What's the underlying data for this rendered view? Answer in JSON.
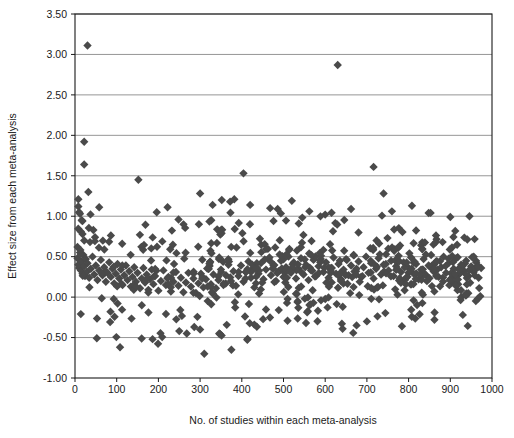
{
  "chart_data": {
    "type": "scatter",
    "title": "",
    "xlabel": "No. of studies within each meta-analysis",
    "ylabel": "Effect size from each meta-analysis",
    "xlim": [
      0,
      1000
    ],
    "ylim": [
      -1.0,
      3.5
    ],
    "xticks": [
      0,
      100,
      200,
      300,
      400,
      500,
      600,
      700,
      800,
      900,
      1000
    ],
    "xtick_labels": [
      "0",
      "100",
      "200",
      "300",
      "400",
      "500",
      "600",
      "700",
      "800",
      "900",
      "1000"
    ],
    "yticks": [
      -1.0,
      -0.5,
      0.0,
      0.5,
      1.0,
      1.5,
      2.0,
      2.5,
      3.0,
      3.5
    ],
    "ytick_labels": [
      "-1.00",
      "-0.50",
      "0.00",
      "0.50",
      "1.00",
      "1.50",
      "2.00",
      "2.50",
      "3.00",
      "3.50"
    ],
    "grid": "horizontal",
    "legend": "none",
    "marker": "diamond",
    "marker_color": "#4a4a4a",
    "marker_size": 4.2,
    "frame_color": "#1a1a1a",
    "grid_color": "#8a8a8a",
    "n_points": 700,
    "points": [
      [
        30,
        3.11
      ],
      [
        630,
        2.87
      ],
      [
        22,
        1.92
      ],
      [
        22,
        1.64
      ],
      [
        32,
        1.3
      ],
      [
        58,
        1.11
      ],
      [
        152,
        1.45
      ],
      [
        8,
        1.21
      ],
      [
        8,
        1.12
      ],
      [
        10,
        1.05
      ],
      [
        12,
        1.03
      ],
      [
        18,
        0.94
      ],
      [
        16,
        0.95
      ],
      [
        14,
        0.81
      ],
      [
        18,
        0.78
      ],
      [
        44,
        0.83
      ],
      [
        48,
        0.74
      ],
      [
        36,
        0.68
      ],
      [
        404,
        1.53
      ],
      [
        716,
        1.61
      ],
      [
        300,
        1.28
      ],
      [
        330,
        1.14
      ],
      [
        222,
        1.11
      ],
      [
        196,
        1.05
      ],
      [
        352,
        1.2
      ],
      [
        372,
        1.18
      ],
      [
        382,
        1.21
      ],
      [
        420,
        1.14
      ],
      [
        468,
        1.1
      ],
      [
        486,
        1.09
      ],
      [
        520,
        1.19
      ],
      [
        562,
        1.06
      ],
      [
        600,
        1.02
      ],
      [
        662,
        1.09
      ],
      [
        740,
        1.28
      ],
      [
        760,
        1.06
      ],
      [
        808,
        1.13
      ],
      [
        848,
        1.04
      ],
      [
        900,
        0.99
      ],
      [
        946,
        1.0
      ],
      [
        108,
        -0.62
      ],
      [
        310,
        -0.7
      ],
      [
        375,
        -0.65
      ],
      [
        186,
        -0.52
      ],
      [
        250,
        -0.42
      ],
      [
        268,
        -0.45
      ],
      [
        346,
        -0.45
      ],
      [
        348,
        -0.46
      ],
      [
        286,
        -0.37
      ],
      [
        300,
        -0.4
      ],
      [
        430,
        -0.34
      ],
      [
        640,
        -0.33
      ],
      [
        700,
        -0.3
      ],
      [
        784,
        -0.36
      ],
      [
        862,
        -0.28
      ],
      [
        930,
        -0.22
      ],
      [
        966,
        -0.02
      ],
      [
        972,
        0.01
      ],
      [
        6,
        0.62
      ],
      [
        6,
        0.48
      ],
      [
        8,
        0.4
      ],
      [
        10,
        0.36
      ],
      [
        12,
        0.55
      ],
      [
        14,
        0.33
      ],
      [
        16,
        0.44
      ],
      [
        18,
        0.29
      ],
      [
        20,
        0.52
      ],
      [
        22,
        0.38
      ],
      [
        24,
        0.26
      ],
      [
        26,
        0.47
      ],
      [
        28,
        0.31
      ],
      [
        30,
        0.42
      ],
      [
        34,
        0.24
      ],
      [
        38,
        0.35
      ],
      [
        42,
        0.5
      ],
      [
        46,
        0.28
      ],
      [
        50,
        0.39
      ],
      [
        54,
        0.21
      ],
      [
        58,
        0.33
      ],
      [
        62,
        0.46
      ],
      [
        66,
        0.27
      ],
      [
        70,
        0.37
      ],
      [
        74,
        0.19
      ],
      [
        78,
        0.3
      ],
      [
        82,
        0.43
      ],
      [
        86,
        0.25
      ],
      [
        90,
        0.35
      ],
      [
        94,
        0.17
      ],
      [
        98,
        0.29
      ],
      [
        102,
        0.41
      ],
      [
        106,
        0.23
      ],
      [
        110,
        0.34
      ],
      [
        114,
        0.15
      ],
      [
        118,
        0.27
      ],
      [
        122,
        0.39
      ],
      [
        126,
        0.21
      ],
      [
        130,
        0.32
      ],
      [
        134,
        0.13
      ],
      [
        138,
        0.25
      ],
      [
        142,
        0.37
      ],
      [
        146,
        0.19
      ],
      [
        150,
        0.3
      ],
      [
        156,
        0.11
      ],
      [
        160,
        0.23
      ],
      [
        164,
        0.36
      ],
      [
        168,
        0.18
      ],
      [
        172,
        0.28
      ],
      [
        176,
        0.09
      ],
      [
        180,
        0.22
      ],
      [
        184,
        0.34
      ],
      [
        188,
        0.16
      ],
      [
        192,
        0.26
      ],
      [
        200,
        0.08
      ],
      [
        206,
        0.2
      ],
      [
        212,
        0.33
      ],
      [
        218,
        0.15
      ],
      [
        224,
        0.25
      ],
      [
        230,
        0.07
      ],
      [
        236,
        0.19
      ],
      [
        242,
        0.31
      ],
      [
        248,
        0.14
      ],
      [
        254,
        0.24
      ],
      [
        260,
        0.06
      ],
      [
        266,
        0.18
      ],
      [
        272,
        0.3
      ],
      [
        278,
        0.13
      ],
      [
        284,
        0.23
      ],
      [
        290,
        0.05
      ],
      [
        296,
        0.17
      ],
      [
        302,
        0.29
      ],
      [
        308,
        0.12
      ],
      [
        314,
        0.22
      ],
      [
        320,
        0.35
      ],
      [
        326,
        0.16
      ],
      [
        332,
        0.28
      ],
      [
        338,
        0.11
      ],
      [
        344,
        0.21
      ],
      [
        350,
        0.34
      ],
      [
        356,
        0.15
      ],
      [
        362,
        0.27
      ],
      [
        368,
        0.4
      ],
      [
        374,
        0.2
      ],
      [
        380,
        0.32
      ],
      [
        386,
        0.14
      ],
      [
        392,
        0.26
      ],
      [
        398,
        0.39
      ],
      [
        404,
        0.19
      ],
      [
        410,
        0.31
      ],
      [
        416,
        0.44
      ],
      [
        422,
        0.24
      ],
      [
        428,
        0.36
      ],
      [
        434,
        0.17
      ],
      [
        440,
        0.29
      ],
      [
        446,
        0.42
      ],
      [
        452,
        0.22
      ],
      [
        458,
        0.34
      ],
      [
        464,
        0.47
      ],
      [
        470,
        0.27
      ],
      [
        476,
        0.39
      ],
      [
        482,
        0.2
      ],
      [
        488,
        0.32
      ],
      [
        494,
        0.45
      ],
      [
        500,
        0.25
      ],
      [
        506,
        0.37
      ],
      [
        512,
        0.5
      ],
      [
        518,
        0.3
      ],
      [
        524,
        0.42
      ],
      [
        530,
        0.23
      ],
      [
        536,
        0.35
      ],
      [
        542,
        0.48
      ],
      [
        548,
        0.28
      ],
      [
        554,
        0.4
      ],
      [
        560,
        0.21
      ],
      [
        566,
        0.33
      ],
      [
        572,
        0.46
      ],
      [
        578,
        0.26
      ],
      [
        584,
        0.38
      ],
      [
        590,
        0.51
      ],
      [
        596,
        0.31
      ],
      [
        602,
        0.43
      ],
      [
        608,
        0.24
      ],
      [
        614,
        0.36
      ],
      [
        620,
        0.49
      ],
      [
        626,
        0.29
      ],
      [
        632,
        0.41
      ],
      [
        638,
        0.22
      ],
      [
        644,
        0.34
      ],
      [
        650,
        0.47
      ],
      [
        656,
        0.27
      ],
      [
        662,
        0.39
      ],
      [
        668,
        0.52
      ],
      [
        674,
        0.32
      ],
      [
        680,
        0.44
      ],
      [
        686,
        0.25
      ],
      [
        692,
        0.37
      ],
      [
        698,
        0.5
      ],
      [
        704,
        0.3
      ],
      [
        710,
        0.42
      ],
      [
        716,
        0.23
      ],
      [
        722,
        0.35
      ],
      [
        728,
        0.48
      ],
      [
        734,
        0.28
      ],
      [
        740,
        0.4
      ],
      [
        746,
        0.53
      ],
      [
        752,
        0.33
      ],
      [
        758,
        0.45
      ],
      [
        764,
        0.26
      ],
      [
        770,
        0.38
      ],
      [
        776,
        0.51
      ],
      [
        782,
        0.31
      ],
      [
        788,
        0.43
      ],
      [
        794,
        0.24
      ],
      [
        800,
        0.36
      ],
      [
        806,
        0.49
      ],
      [
        812,
        0.29
      ],
      [
        818,
        0.41
      ],
      [
        824,
        0.22
      ],
      [
        830,
        0.34
      ],
      [
        836,
        0.47
      ],
      [
        842,
        0.27
      ],
      [
        848,
        0.39
      ],
      [
        854,
        0.52
      ],
      [
        860,
        0.32
      ],
      [
        866,
        0.44
      ],
      [
        872,
        0.25
      ],
      [
        878,
        0.37
      ],
      [
        884,
        0.5
      ],
      [
        890,
        0.3
      ],
      [
        896,
        0.42
      ],
      [
        902,
        0.23
      ],
      [
        908,
        0.35
      ],
      [
        914,
        0.48
      ],
      [
        920,
        0.28
      ],
      [
        926,
        0.4
      ],
      [
        932,
        0.33
      ],
      [
        938,
        0.45
      ],
      [
        944,
        0.26
      ],
      [
        950,
        0.38
      ],
      [
        956,
        0.31
      ],
      [
        962,
        0.43
      ],
      [
        968,
        0.24
      ],
      [
        974,
        0.36
      ]
    ]
  }
}
